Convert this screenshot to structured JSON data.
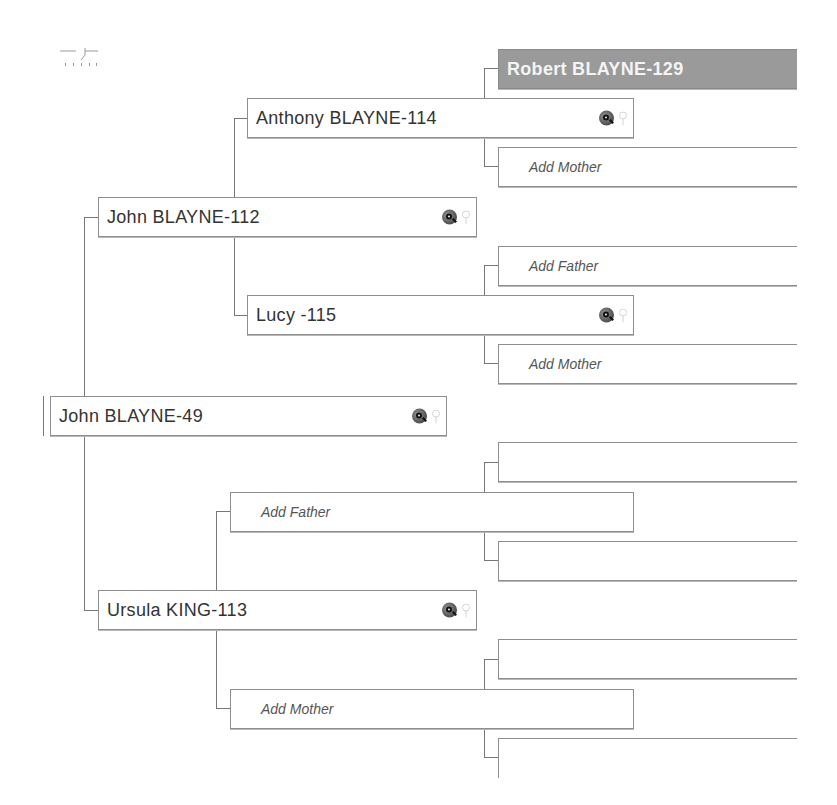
{
  "chart": {
    "view_icon": "pedigree-view-icon",
    "root": {
      "name": "John BLAYNE-49",
      "icons": [
        "search-icon",
        "family-tree-icon"
      ]
    },
    "generation1": [
      {
        "name": "John BLAYNE-112",
        "relation": "father",
        "icons": [
          "search-icon",
          "family-tree-icon"
        ]
      },
      {
        "name": "Ursula KING-113",
        "relation": "mother",
        "icons": [
          "search-icon",
          "family-tree-icon"
        ]
      }
    ],
    "generation2": [
      {
        "name": "Anthony BLAYNE-114",
        "relation": "paternal-grandfather",
        "icons": [
          "search-icon",
          "family-tree-icon"
        ]
      },
      {
        "name": "Lucy -115",
        "relation": "paternal-grandmother",
        "icons": [
          "search-icon",
          "family-tree-icon"
        ]
      },
      {
        "name": "Add Father",
        "relation": "maternal-grandfather",
        "placeholder": true
      },
      {
        "name": "Add Mother",
        "relation": "maternal-grandmother",
        "placeholder": true
      }
    ],
    "generation3": [
      {
        "name": "Robert BLAYNE-129",
        "highlighted": true
      },
      {
        "name": "Add Mother",
        "placeholder": true
      },
      {
        "name": "Add Father",
        "placeholder": true
      },
      {
        "name": "Add Mother",
        "placeholder": true
      },
      {
        "name": "",
        "empty": true
      },
      {
        "name": "",
        "empty": true
      },
      {
        "name": "",
        "empty": true
      },
      {
        "name": "",
        "empty": true
      }
    ]
  },
  "colors": {
    "highlight_bg": "#9a9a9a",
    "border": "#8e8e8e",
    "connector": "#777777",
    "text": "#333333"
  }
}
